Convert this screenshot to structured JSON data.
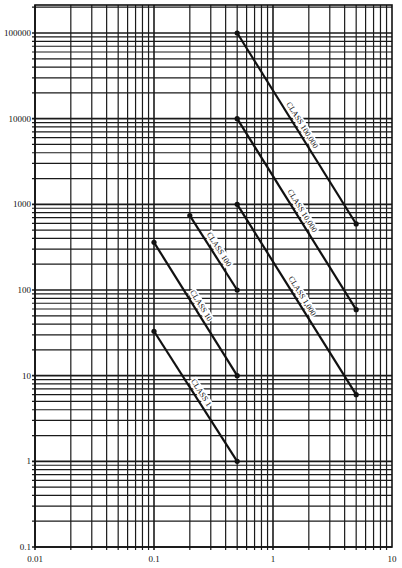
{
  "chart_data": {
    "type": "line",
    "title": "",
    "xlabel": "",
    "ylabel": "",
    "xscale": "log",
    "yscale": "log",
    "xlim": [
      0.01,
      10
    ],
    "ylim": [
      0.1,
      200000
    ],
    "grid": true,
    "legend": "none (inline labels on lines)",
    "x_tick_labels": [
      "0.01",
      "0.1",
      "1",
      "10"
    ],
    "y_tick_labels": [
      "0.1",
      "1",
      "10",
      "100",
      "1000",
      "10000",
      "100000"
    ],
    "series": [
      {
        "name": "CLASS 100,000",
        "label": "CLASS 100,000",
        "x": [
          0.5,
          5
        ],
        "y": [
          100000,
          590
        ]
      },
      {
        "name": "CLASS 10,000",
        "label": "CLASS 10,000",
        "x": [
          0.5,
          5
        ],
        "y": [
          10000,
          59
        ]
      },
      {
        "name": "CLASS 1,000",
        "label": "CLASS 1,000",
        "x": [
          0.5,
          5
        ],
        "y": [
          1000,
          6
        ]
      },
      {
        "name": "CLASS 100",
        "label": "CLASS 100",
        "x": [
          0.2,
          0.5
        ],
        "y": [
          740,
          100
        ]
      },
      {
        "name": "CLASS 10",
        "label": "CLASS 10",
        "x": [
          0.1,
          0.5
        ],
        "y": [
          360,
          10
        ]
      },
      {
        "name": "CLASS 1",
        "label": "CLASS 1",
        "x": [
          0.1,
          0.5
        ],
        "y": [
          33,
          1
        ]
      }
    ]
  },
  "layout": {
    "plot_left": 35,
    "plot_right": 392,
    "plot_top": 5,
    "plot_bottom": 547,
    "line_color": "#111111",
    "grid_color": "#1a1a1a",
    "background": "#ffffff"
  }
}
